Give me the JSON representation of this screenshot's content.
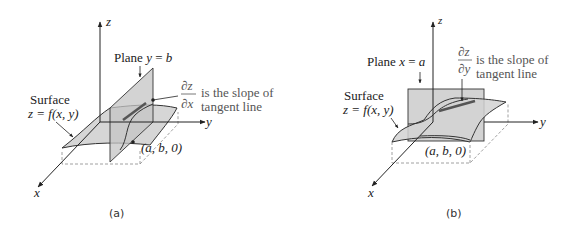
{
  "panels": [
    {
      "id": "a",
      "caption": "(a)",
      "axes": {
        "x": "x",
        "y": "y",
        "z": "z"
      },
      "plane_label": "Plane y = b",
      "plane_label_parts": {
        "prefix": "Plane ",
        "var": "y",
        "eq": " = ",
        "val": "b"
      },
      "surface_label": [
        "Surface",
        "z = f(x, y)"
      ],
      "derivative": {
        "numerator": "∂z",
        "denominator": "∂x"
      },
      "slope_text": [
        "is the slope of",
        "tangent line"
      ],
      "point_label": "(a, b, 0)"
    },
    {
      "id": "b",
      "caption": "(b)",
      "axes": {
        "x": "x",
        "y": "y",
        "z": "z"
      },
      "plane_label": "Plane x = a",
      "plane_label_parts": {
        "prefix": "Plane ",
        "var": "x",
        "eq": " = ",
        "val": "a"
      },
      "surface_label": [
        "Surface",
        "z = f(x, y)"
      ],
      "derivative": {
        "numerator": "∂z",
        "denominator": "∂y"
      },
      "slope_text": [
        "is the slope of",
        "tangent line"
      ],
      "point_label": "(a, b, 0)"
    }
  ],
  "colors": {
    "surface_fill": "#d6d6d6",
    "plane_fill": "#c8c8c8",
    "line": "#333333",
    "tangent": "#555555",
    "dashed": "#888888"
  }
}
